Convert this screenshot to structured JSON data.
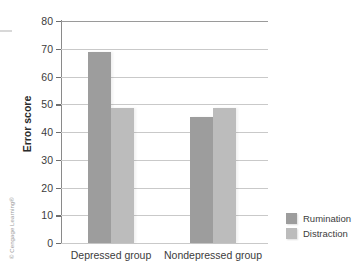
{
  "figure": {
    "credit": "© Cengage Learning®"
  },
  "chart_data": {
    "type": "bar",
    "title": "",
    "xlabel": "",
    "ylabel": "Error score",
    "ylim": [
      0,
      80
    ],
    "yticks": [
      0,
      10,
      20,
      30,
      40,
      50,
      60,
      70,
      80
    ],
    "ytick_labels": [
      "0",
      "10",
      "20",
      "30",
      "40",
      "50",
      "60",
      "70",
      "80"
    ],
    "grid": true,
    "legend_position": "right-bottom",
    "categories": [
      "Depressed group",
      "Nondepressed group"
    ],
    "series": [
      {
        "name": "Rumination",
        "color": "#9d9d9d",
        "values": [
          69,
          45.5
        ]
      },
      {
        "name": "Distraction",
        "color": "#bcbcbc",
        "values": [
          48.5,
          48.5
        ]
      }
    ]
  }
}
